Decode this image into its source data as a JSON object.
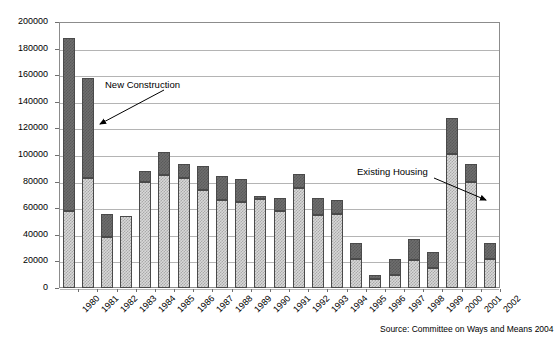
{
  "chart_data": {
    "type": "bar",
    "stacked": true,
    "title": "",
    "xlabel": "",
    "ylabel": "",
    "ylim": [
      0,
      200000
    ],
    "ytick_step": 20000,
    "yticks": [
      "200000",
      "180000",
      "160000",
      "140000",
      "120000",
      "100000",
      "80000",
      "60000",
      "40000",
      "20000",
      "0"
    ],
    "grid": true,
    "legend": "annotations",
    "categories": [
      "1980",
      "1981",
      "1982",
      "1983",
      "1984",
      "1985",
      "1986",
      "1987",
      "1988",
      "1989",
      "1990",
      "1991",
      "1992",
      "1993",
      "1994",
      "1995",
      "1996",
      "1997",
      "1998",
      "1999",
      "2000",
      "2001",
      "2002"
    ],
    "series": [
      {
        "name": "Existing Housing",
        "color": "#d8d8d8",
        "values": [
          58000,
          83000,
          38000,
          54000,
          80000,
          85000,
          83000,
          74000,
          66000,
          65000,
          67000,
          58000,
          75000,
          55000,
          56000,
          22000,
          7000,
          10000,
          21000,
          15000,
          101000,
          80000,
          22000
        ]
      },
      {
        "name": "New Construction",
        "color": "#6e6e6e",
        "values": [
          130000,
          75000,
          18000,
          0,
          8000,
          17000,
          10000,
          18000,
          18000,
          17000,
          2000,
          10000,
          11000,
          13000,
          10000,
          12000,
          3000,
          12000,
          16000,
          12000,
          27000,
          13000,
          12000
        ]
      }
    ],
    "totals": [
      188000,
      158000,
      56000,
      54000,
      88000,
      102000,
      93000,
      92000,
      84000,
      82000,
      69000,
      68000,
      86000,
      68000,
      66000,
      34000,
      10000,
      22000,
      37000,
      27000,
      128000,
      93000,
      34000
    ],
    "annotations": [
      {
        "id": "new-construction",
        "text": "New Construction"
      },
      {
        "id": "existing-housing",
        "text": "Existing Housing"
      }
    ],
    "source_note": "Source: Committee on Ways and Means 2004"
  }
}
